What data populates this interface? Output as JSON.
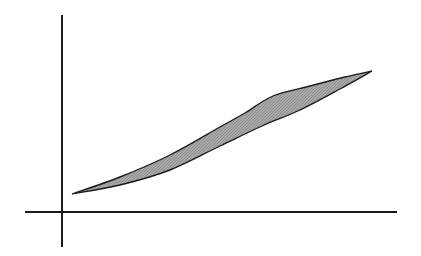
{
  "figure": {
    "background_color": "#ffffff",
    "width": 421,
    "height": 256,
    "axes": {
      "name": "cartesian-axes",
      "stroke_color": "#1a1a1a",
      "stroke_width": 1.9,
      "origin": {
        "x": 62,
        "y": 212
      },
      "x_axis": {
        "x1": 25,
        "y1": 212,
        "x2": 397,
        "y2": 212
      },
      "y_axis": {
        "x1": 62,
        "y1": 15,
        "x2": 62,
        "y2": 247
      },
      "tick_labels": [],
      "x_label": "",
      "y_label": ""
    },
    "region": {
      "name": "shaded-lens-region",
      "fill_color": "#a9a9a9",
      "outline_color": "#1c1c1c",
      "outline_width": 1.35,
      "left_tip": {
        "x": 72,
        "y": 194
      },
      "right_tip": {
        "x": 372,
        "y": 71
      },
      "upper_path": "M 72 194 C 140 171 205 139 245 114 L 273 96 C 308 85 345 76 372 71",
      "lower_path": "M 372 71 C 335 92 300 111 262 126 C 210 147 135 179 72 194",
      "upper_boundary_points": [
        {
          "x": 72,
          "y": 194
        },
        {
          "x": 120,
          "y": 177
        },
        {
          "x": 170,
          "y": 155
        },
        {
          "x": 220,
          "y": 127
        },
        {
          "x": 245,
          "y": 113
        },
        {
          "x": 273,
          "y": 96
        },
        {
          "x": 310,
          "y": 86
        },
        {
          "x": 345,
          "y": 77
        },
        {
          "x": 372,
          "y": 71
        }
      ],
      "lower_boundary_points": [
        {
          "x": 72,
          "y": 194
        },
        {
          "x": 120,
          "y": 185
        },
        {
          "x": 170,
          "y": 170
        },
        {
          "x": 220,
          "y": 146
        },
        {
          "x": 262,
          "y": 126
        },
        {
          "x": 300,
          "y": 110
        },
        {
          "x": 340,
          "y": 89
        },
        {
          "x": 372,
          "y": 71
        }
      ],
      "kink_vertex": {
        "x": 273,
        "y": 96
      },
      "max_thickness_px": 23
    }
  },
  "chart_data": {
    "type": "area",
    "title": "",
    "subtitle": "",
    "xlabel": "",
    "ylabel": "",
    "grid": false,
    "legend": null,
    "annotations": [],
    "xlim": [
      0,
      1
    ],
    "ylim": [
      0,
      1
    ],
    "series": [
      {
        "name": "upper-curve",
        "x": [
          0.03,
          0.17,
          0.32,
          0.47,
          0.55,
          0.63,
          0.74,
          0.85,
          0.93
        ],
        "y": [
          0.09,
          0.18,
          0.29,
          0.43,
          0.5,
          0.59,
          0.63,
          0.68,
          0.71
        ]
      },
      {
        "name": "lower-curve",
        "x": [
          0.03,
          0.17,
          0.32,
          0.47,
          0.6,
          0.71,
          0.83,
          0.93
        ],
        "y": [
          0.09,
          0.13,
          0.21,
          0.33,
          0.44,
          0.52,
          0.62,
          0.71
        ]
      }
    ],
    "shaded_between": [
      "upper-curve",
      "lower-curve"
    ],
    "shade_color": "#a9a9a9"
  }
}
